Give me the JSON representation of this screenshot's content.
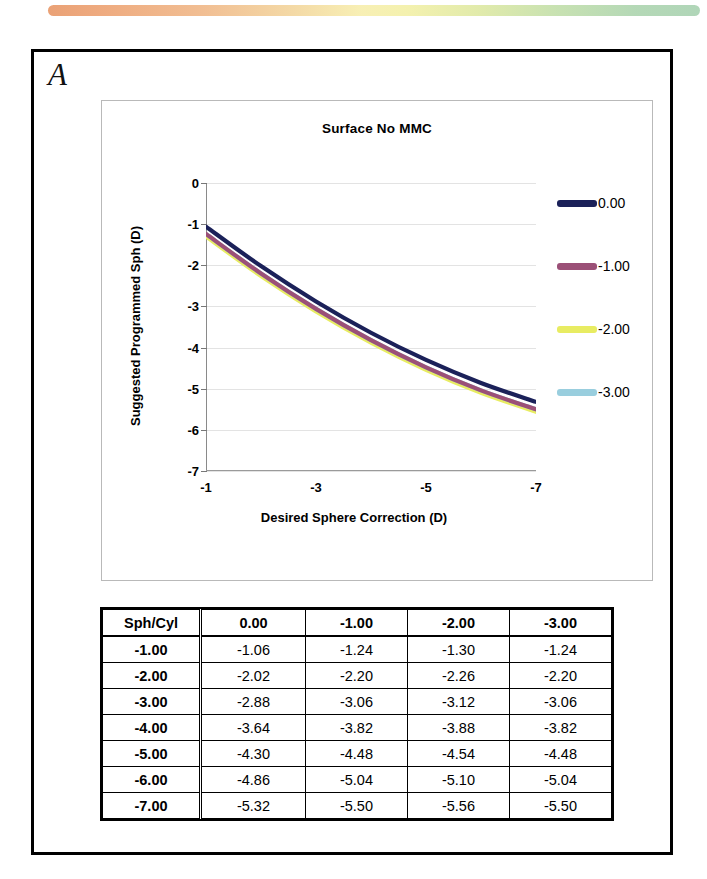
{
  "figure": {
    "panel_label": "A",
    "gradient_bar": {
      "colors": [
        "#e8996a",
        "#f3d79f",
        "#f7eeae",
        "#c3dfab",
        "#a9d2b2"
      ]
    }
  },
  "chart_data": {
    "type": "line",
    "title": "Surface No MMC",
    "xlabel": "Desired Sphere Correction (D)",
    "ylabel": "Suggested Programmed Sph (D)",
    "grid": true,
    "legend_position": "right",
    "x": [
      -1,
      -2,
      -3,
      -4,
      -5,
      -6,
      -7
    ],
    "xticks": [
      "-1",
      "-3",
      "-5",
      "-7"
    ],
    "xtick_values": [
      -1,
      -3,
      -5,
      -7
    ],
    "xlim": [
      -1,
      -7
    ],
    "yticks": [
      "-7",
      "-6",
      "-5",
      "-4",
      "-3",
      "-2",
      "-1",
      "0"
    ],
    "ytick_values": [
      -7,
      -6,
      -5,
      -4,
      -3,
      -2,
      -1,
      0
    ],
    "ylim": [
      0,
      -7
    ],
    "series": [
      {
        "name": "0.00",
        "color": "#1b2159",
        "values": [
          -1.06,
          -2.02,
          -2.88,
          -3.64,
          -4.3,
          -4.86,
          -5.32
        ]
      },
      {
        "name": "-1.00",
        "color": "#9b5077",
        "values": [
          -1.24,
          -2.2,
          -3.06,
          -3.82,
          -4.48,
          -5.04,
          -5.5
        ]
      },
      {
        "name": "-2.00",
        "color": "#e8ec62",
        "values": [
          -1.3,
          -2.26,
          -3.12,
          -3.88,
          -4.54,
          -5.1,
          -5.56
        ]
      },
      {
        "name": "-3.00",
        "color": "#99cede",
        "values": [
          -1.24,
          -2.2,
          -3.06,
          -3.82,
          -4.48,
          -5.04,
          -5.5
        ]
      }
    ]
  },
  "table": {
    "headers": [
      "Sph/Cyl",
      "0.00",
      "-1.00",
      "-2.00",
      "-3.00"
    ],
    "rows": [
      {
        "label": "-1.00",
        "values": [
          "-1.06",
          "-1.24",
          "-1.30",
          "-1.24"
        ]
      },
      {
        "label": "-2.00",
        "values": [
          "-2.02",
          "-2.20",
          "-2.26",
          "-2.20"
        ]
      },
      {
        "label": "-3.00",
        "values": [
          "-2.88",
          "-3.06",
          "-3.12",
          "-3.06"
        ]
      },
      {
        "label": "-4.00",
        "values": [
          "-3.64",
          "-3.82",
          "-3.88",
          "-3.82"
        ]
      },
      {
        "label": "-5.00",
        "values": [
          "-4.30",
          "-4.48",
          "-4.54",
          "-4.48"
        ]
      },
      {
        "label": "-6.00",
        "values": [
          "-4.86",
          "-5.04",
          "-5.10",
          "-5.04"
        ]
      },
      {
        "label": "-7.00",
        "values": [
          "-5.32",
          "-5.50",
          "-5.56",
          "-5.50"
        ]
      }
    ]
  }
}
